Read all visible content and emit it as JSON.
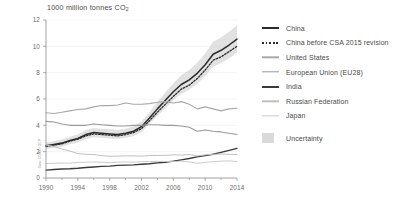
{
  "chart_data": {
    "type": "line",
    "title": "1000 million tonnes CO",
    "title_sub": "2",
    "xlabel": "",
    "ylabel": "",
    "xlim": [
      1990,
      2014
    ],
    "ylim": [
      0,
      12
    ],
    "yticks": [
      0,
      2,
      4,
      6,
      8,
      10,
      12
    ],
    "xticks": [
      1990,
      1994,
      1998,
      2002,
      2006,
      2010,
      2014
    ],
    "xtick_labels": [
      "1990",
      "1994",
      "1998",
      "2002",
      "2006",
      "2010",
      "2014"
    ],
    "ytick_labels": [
      "0",
      "2",
      "4",
      "6",
      "8",
      "10",
      "12"
    ],
    "grid": true,
    "legend_position": "right",
    "credit": "Data: CDIAC / GCP",
    "x": [
      1990,
      1991,
      1992,
      1993,
      1994,
      1995,
      1996,
      1997,
      1998,
      1999,
      2000,
      2001,
      2002,
      2003,
      2004,
      2005,
      2006,
      2007,
      2008,
      2009,
      2010,
      2011,
      2012,
      2013,
      2014
    ],
    "series": [
      {
        "name": "China",
        "color": "#2b2b2b",
        "width": 1.5,
        "dash": "none",
        "values": [
          2.45,
          2.55,
          2.65,
          2.85,
          3.0,
          3.3,
          3.45,
          3.4,
          3.35,
          3.3,
          3.4,
          3.55,
          3.9,
          4.55,
          5.25,
          5.9,
          6.55,
          7.1,
          7.45,
          7.95,
          8.6,
          9.4,
          9.7,
          10.1,
          10.55
        ]
      },
      {
        "name": "China before CSA 2015 revision",
        "color": "#2b2b2b",
        "width": 1.3,
        "dash": "1.6 1.6",
        "values": [
          2.4,
          2.5,
          2.6,
          2.8,
          2.95,
          3.2,
          3.35,
          3.3,
          3.25,
          3.2,
          3.3,
          3.45,
          3.75,
          4.35,
          5.0,
          5.6,
          6.2,
          6.75,
          7.05,
          7.55,
          8.2,
          8.95,
          9.2,
          9.6,
          10.0
        ]
      },
      {
        "name": "United States",
        "color": "#a8a8a8",
        "width": 1.1,
        "dash": "none",
        "values": [
          4.95,
          4.9,
          5.0,
          5.1,
          5.2,
          5.25,
          5.4,
          5.5,
          5.5,
          5.55,
          5.7,
          5.6,
          5.6,
          5.65,
          5.75,
          5.8,
          5.7,
          5.8,
          5.6,
          5.25,
          5.4,
          5.25,
          5.1,
          5.25,
          5.3
        ]
      },
      {
        "name": "European Union (EU28)",
        "color": "#9a9a9a",
        "width": 1.1,
        "dash": "none",
        "values": [
          4.3,
          4.25,
          4.1,
          4.0,
          4.0,
          4.0,
          4.1,
          4.05,
          4.0,
          3.95,
          3.95,
          4.0,
          4.0,
          4.05,
          4.05,
          4.0,
          4.0,
          3.95,
          3.85,
          3.55,
          3.65,
          3.55,
          3.5,
          3.4,
          3.3
        ]
      },
      {
        "name": "India",
        "color": "#3a3a3a",
        "width": 1.4,
        "dash": "none",
        "values": [
          0.6,
          0.65,
          0.68,
          0.7,
          0.74,
          0.8,
          0.84,
          0.88,
          0.9,
          0.96,
          0.98,
          1.0,
          1.04,
          1.08,
          1.15,
          1.2,
          1.28,
          1.38,
          1.48,
          1.6,
          1.7,
          1.8,
          1.95,
          2.1,
          2.25
        ]
      },
      {
        "name": "Russian Federation",
        "color": "#c0c0c0",
        "width": 1.0,
        "dash": "none",
        "values": [
          2.5,
          2.4,
          2.2,
          2.05,
          1.85,
          1.8,
          1.78,
          1.7,
          1.65,
          1.66,
          1.68,
          1.68,
          1.66,
          1.7,
          1.72,
          1.72,
          1.76,
          1.74,
          1.78,
          1.68,
          1.76,
          1.8,
          1.82,
          1.8,
          1.78
        ]
      },
      {
        "name": "Japan",
        "color": "#cccccc",
        "width": 1.0,
        "dash": "none",
        "values": [
          1.1,
          1.12,
          1.14,
          1.12,
          1.18,
          1.2,
          1.22,
          1.2,
          1.16,
          1.2,
          1.22,
          1.2,
          1.24,
          1.25,
          1.26,
          1.25,
          1.24,
          1.28,
          1.22,
          1.12,
          1.18,
          1.24,
          1.28,
          1.3,
          1.25
        ]
      }
    ],
    "uncertainty_band": {
      "series": "China",
      "label": "Uncertainty",
      "color": "#c9c9c9",
      "lower": [
        2.2,
        2.3,
        2.38,
        2.56,
        2.7,
        2.96,
        3.1,
        3.05,
        3.0,
        2.96,
        3.05,
        3.18,
        3.5,
        4.1,
        4.72,
        5.3,
        5.9,
        6.4,
        6.7,
        7.15,
        7.74,
        8.45,
        8.73,
        9.1,
        9.5
      ],
      "upper": [
        2.7,
        2.8,
        2.92,
        3.14,
        3.3,
        3.64,
        3.8,
        3.75,
        3.7,
        3.64,
        3.75,
        3.92,
        4.3,
        5.0,
        5.78,
        6.5,
        7.2,
        7.8,
        8.2,
        8.75,
        9.46,
        10.35,
        10.67,
        11.1,
        11.6
      ]
    },
    "legend": [
      {
        "label": "China",
        "style": "solid",
        "color": "#2b2b2b",
        "width": 2
      },
      {
        "label": "China before CSA 2015 revision",
        "style": "dotted",
        "color": "#2b2b2b",
        "width": 2
      },
      {
        "label": "United States",
        "style": "solid",
        "color": "#a8a8a8",
        "width": 1.4
      },
      {
        "label": "European Union (EU28)",
        "style": "solid",
        "color": "#9a9a9a",
        "width": 1.4
      },
      {
        "label": "India",
        "style": "solid",
        "color": "#3a3a3a",
        "width": 2
      },
      {
        "label": "Russian Federation",
        "style": "solid",
        "color": "#c0c0c0",
        "width": 1.4
      },
      {
        "label": "Japan",
        "style": "solid",
        "color": "#cccccc",
        "width": 1.4
      },
      {
        "label": "Uncertainty",
        "style": "box",
        "color": "#d2d2d2",
        "width": 0
      }
    ]
  }
}
